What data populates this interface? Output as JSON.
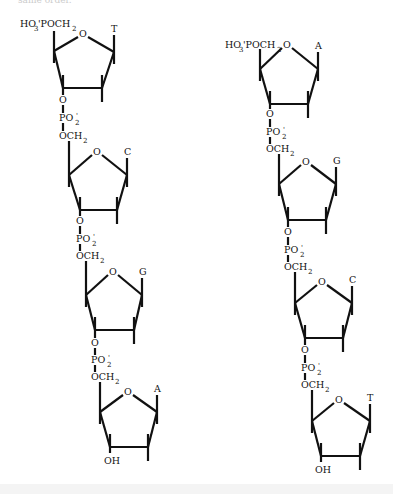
{
  "caption_fragment": "same order.",
  "strands": [
    {
      "name": "left-strand",
      "five_prime_label": {
        "main": "HO",
        "sub": "3",
        "rest": "'POCH",
        "sub2": "2",
        "x": 20,
        "y": 27
      },
      "units": [
        {
          "base": "T",
          "ring": {
            "O": [
              83,
              34
            ],
            "C4": [
              54,
              51
            ],
            "C1": [
              114,
              52
            ],
            "C3": [
              63,
              88
            ],
            "C2": [
              102,
              88
            ]
          },
          "link": {
            "O_y": 103,
            "P_y": 121,
            "OCH2_y": 139,
            "x": 63
          }
        },
        {
          "base": "C",
          "ring": {
            "O": [
              97,
              152
            ],
            "C4": [
              69,
              175
            ],
            "C1": [
              127,
              175
            ],
            "C3": [
              80,
              210
            ],
            "C2": [
              117,
              210
            ]
          },
          "link": {
            "O_y": 224,
            "P_y": 242,
            "OCH2_y": 259,
            "x": 80
          }
        },
        {
          "base": "G",
          "ring": {
            "O": [
              113,
              272
            ],
            "C4": [
              86,
              295
            ],
            "C1": [
              142,
              295
            ],
            "C3": [
              95,
              330
            ],
            "C2": [
              134,
              330
            ]
          },
          "link": {
            "O_y": 346,
            "P_y": 363,
            "OCH2_y": 380,
            "x": 95
          }
        },
        {
          "base": "A",
          "ring": {
            "O": [
              128,
              392
            ],
            "C4": [
              100,
              412
            ],
            "C1": [
              157,
              412
            ],
            "C3": [
              110,
              447
            ],
            "C2": [
              148,
              447
            ]
          },
          "terminal": "OH"
        }
      ]
    },
    {
      "name": "right-strand",
      "five_prime_label": {
        "main": "HO",
        "sub": "3",
        "rest": "'POCH",
        "sub2": "2",
        "x": 225,
        "y": 48
      },
      "units": [
        {
          "base": "A",
          "ring": {
            "O": [
              287,
              45
            ],
            "C4": [
              260,
              69
            ],
            "C1": [
              318,
              69
            ],
            "C3": [
              270,
              104
            ],
            "C2": [
              308,
              104
            ]
          },
          "link": {
            "O_y": 117,
            "P_y": 135,
            "OCH2_y": 152,
            "x": 270
          }
        },
        {
          "base": "G",
          "ring": {
            "O": [
              306,
              162
            ],
            "C4": [
              279,
              184
            ],
            "C1": [
              336,
              184
            ],
            "C3": [
              288,
              220
            ],
            "C2": [
              326,
              220
            ]
          },
          "link": {
            "O_y": 235,
            "P_y": 253,
            "OCH2_y": 270,
            "x": 288
          }
        },
        {
          "base": "C",
          "ring": {
            "O": [
              322,
              282
            ],
            "C4": [
              295,
              303
            ],
            "C1": [
              352,
              303
            ],
            "C3": [
              305,
              338
            ],
            "C2": [
              343,
              338
            ]
          },
          "link": {
            "O_y": 353,
            "P_y": 371,
            "OCH2_y": 388,
            "x": 305
          }
        },
        {
          "base": "T",
          "ring": {
            "O": [
              339,
              400
            ],
            "C4": [
              312,
              421
            ],
            "C1": [
              370,
              421
            ],
            "C3": [
              321,
              456
            ],
            "C2": [
              360,
              456
            ]
          },
          "terminal": "OH"
        }
      ]
    }
  ],
  "labels": {
    "phosphate": "PO",
    "phosphate_sub": "2",
    "phosphate_charge": "'",
    "ester_O": "O",
    "methylene": "OCH",
    "methylene_sub": "2",
    "ring_O": "O",
    "hydroxyl": "OH"
  }
}
